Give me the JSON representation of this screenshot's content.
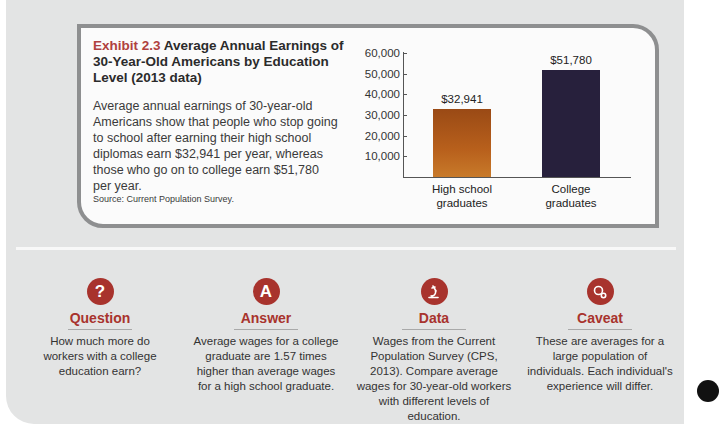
{
  "exhibit": {
    "number": "Exhibit 2.3",
    "title": "Average Annual Earnings of 30-Year-Old Americans by Education Level (2013 data)",
    "description": "Average annual earnings of 30-year-old Americans show that people who stop going to school after earning their high school diplomas earn $32,941 per year, whereas those who go on to college earn $51,780 per year.",
    "source": "Source: Current Population Survey."
  },
  "chart_data": {
    "type": "bar",
    "title": "Average Annual Earnings of 30-Year-Old Americans by Education Level (2013 data)",
    "categories": [
      "High school graduates",
      "College graduates"
    ],
    "category_lines": [
      [
        "High school",
        "graduates"
      ],
      [
        "College",
        "graduates"
      ]
    ],
    "values": [
      32941,
      51780
    ],
    "value_labels": [
      "$32,941",
      "$51,780"
    ],
    "colors": [
      "#b35a1b",
      "#27203c"
    ],
    "xlabel": "",
    "ylabel": "",
    "ylim": [
      0,
      60000
    ],
    "yticks": [
      10000,
      20000,
      30000,
      40000,
      50000,
      60000
    ],
    "ytick_labels": [
      "10,000",
      "20,000",
      "30,000",
      "40,000",
      "50,000",
      "60,000"
    ],
    "grid": false,
    "legend": null
  },
  "panels": [
    {
      "icon": "question-icon",
      "glyph": "?",
      "title": "Question",
      "text": "How much more do workers with a college education earn?"
    },
    {
      "icon": "answer-icon",
      "glyph": "A",
      "title": "Answer",
      "text": "Average wages for a college graduate are 1.57 times higher than average wages for a high school graduate."
    },
    {
      "icon": "microscope-icon",
      "glyph": "",
      "title": "Data",
      "text": "Wages from the Current Population Survey (CPS, 2013). Compare average wages for 30-year-old workers with different levels of education."
    },
    {
      "icon": "caveat-gears-icon",
      "glyph": "",
      "title": "Caveat",
      "text": "These are averages for a large population of individuals. Each individual's experience will differ."
    }
  ],
  "colors": {
    "accent": "#a8332d",
    "page_bg": "#e3e4e4",
    "box_border": "#8e8f90"
  }
}
